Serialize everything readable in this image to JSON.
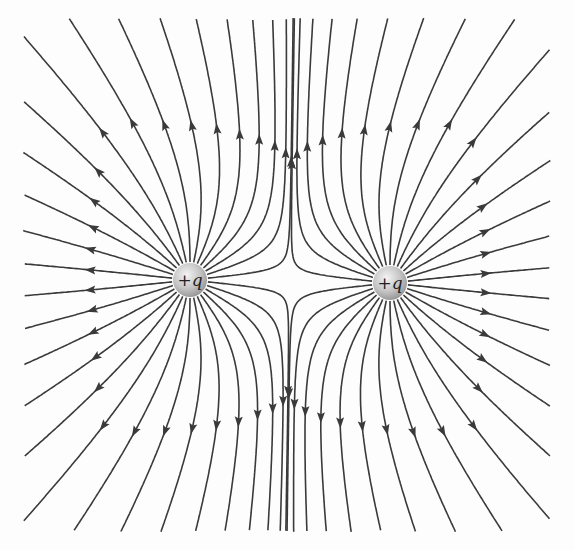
{
  "diagram": {
    "charges": [
      {
        "label": "+q",
        "x": 190,
        "y": 280,
        "q": 1
      },
      {
        "label": "+q",
        "x": 390,
        "y": 283,
        "q": 1
      }
    ],
    "lines_per_charge": 30,
    "colors": {
      "line": "#3a3a3a",
      "charge_fill": "#c8c8c8",
      "background": "#fdfdfd"
    }
  }
}
